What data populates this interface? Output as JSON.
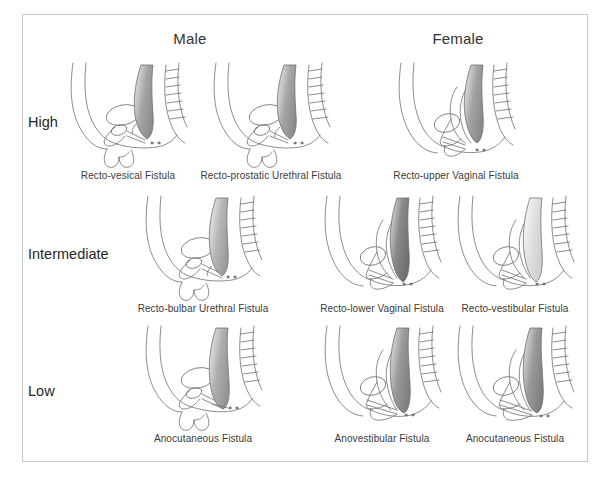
{
  "figure": {
    "border_color": "#c9c9c9",
    "background_color": "#ffffff",
    "text_color": "#2b2b2b"
  },
  "columns": [
    {
      "id": "male",
      "label": "Male"
    },
    {
      "id": "female",
      "label": "Female"
    }
  ],
  "rows": [
    {
      "id": "high",
      "label": "High"
    },
    {
      "id": "intermediate",
      "label": "Intermediate"
    },
    {
      "id": "low",
      "label": "Low"
    }
  ],
  "cells": [
    {
      "row": "high",
      "column": "male",
      "caption": "Recto-vesical Fistula",
      "figure_kind": "male-pelvis-sagittal",
      "shading": "#9a9a9a"
    },
    {
      "row": "high",
      "column": "male",
      "caption": "Recto-prostatic Urethral Fistula",
      "figure_kind": "male-pelvis-sagittal",
      "shading": "#9a9a9a"
    },
    {
      "row": "high",
      "column": "female",
      "caption": "Recto-upper Vaginal Fistula",
      "figure_kind": "female-pelvis-sagittal",
      "shading": "#9a9a9a"
    },
    {
      "row": "intermediate",
      "column": "male",
      "caption": "Recto-bulbar Urethral Fistula",
      "figure_kind": "male-pelvis-sagittal",
      "shading": "#b0b0b0"
    },
    {
      "row": "intermediate",
      "column": "female",
      "caption": "Recto-lower Vaginal Fistula",
      "figure_kind": "female-pelvis-sagittal",
      "shading": "#7d7d7d"
    },
    {
      "row": "intermediate",
      "column": "female",
      "caption": "Recto-vestibular Fistula",
      "figure_kind": "female-pelvis-sagittal",
      "shading": "#d8d8d8"
    },
    {
      "row": "low",
      "column": "male",
      "caption": "Anocutaneous Fistula",
      "figure_kind": "male-pelvis-sagittal",
      "shading": "#a8a8a8"
    },
    {
      "row": "low",
      "column": "female",
      "caption": "Anovestibular Fistula",
      "figure_kind": "female-pelvis-sagittal",
      "shading": "#8c8c8c"
    },
    {
      "row": "low",
      "column": "female",
      "caption": "Anocutaneous Fistula",
      "figure_kind": "female-pelvis-sagittal",
      "shading": "#8c8c8c"
    }
  ]
}
